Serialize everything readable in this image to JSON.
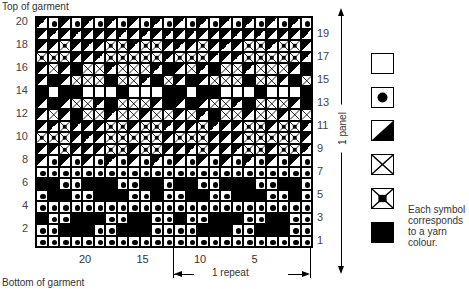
{
  "labels": {
    "top": "Top of garment",
    "bottom": "Bottom of garment",
    "panel": "1 panel",
    "repeat": "1 repeat",
    "note": "Each symbol corresponds to a yarn colour."
  },
  "left_row_numbers": [
    "20",
    "18",
    "16",
    "14",
    "12",
    "10",
    "8",
    "6",
    "4",
    "2"
  ],
  "right_row_numbers": [
    "19",
    "17",
    "15",
    "13",
    "11",
    "9",
    "7",
    "5",
    "3",
    "1"
  ],
  "column_numbers": [
    "20",
    "15",
    "10",
    "5"
  ],
  "legend": [
    {
      "symbol": "white-square",
      "code": "W"
    },
    {
      "symbol": "dot",
      "code": "D"
    },
    {
      "symbol": "diagonal-half",
      "code": "G"
    },
    {
      "symbol": "cross",
      "code": "X"
    },
    {
      "symbol": "framed-cross",
      "code": "F"
    },
    {
      "symbol": "black-square",
      "code": "B"
    }
  ],
  "chart_data": {
    "type": "table",
    "columns": 24,
    "rows": 20,
    "repeat_width": 12,
    "codes": {
      "W": "white",
      "D": "dot",
      "G": "diagonal",
      "X": "cross",
      "F": "framed cross",
      "B": "black"
    },
    "grid_top_to_bottom": [
      "GDGDGDGDGDGDGDGDGDGDGDGD",
      "GGGGGGGGGGGGGGGGGGGGGGGG",
      "GGFGGGFFGFFGGGFGGGFFGFFG",
      "FFFGGGFFFFFGFFFGGGFFFFFG",
      "GXGBXXGXXXGBGXGBXXGXXXGB",
      "GBGXXXBXXGBXGBGXXXBXXGBX",
      "BWBBWWWBWWWBBWBBWWWBWWWB",
      "GBGXXGBXXXGBGBGXXGBXXXGB",
      "GXGBXXGXXGXXGXGBXXGXXGXX",
      "GGFGGGFFGFFGGGFGGGFFGFFG",
      "FFFGGGFFFFFGFFFGGGFFFFFG",
      "GGFGGGFFGFFGGGFGGGFFGFFG",
      "GDGDGDGDGDGDGDGDGDGDGDGD",
      "DDDDDDDDDDDDDDDDDDDDDDDD",
      "BBDDBBBDDBBDBBDDBBBDDBBD",
      "DBBDDBBBDDBDDBBDDBBBDDBD",
      "DDDDDDDDDDDDDDDDDDDDDDDD",
      "BDDBBBDDBBDDBDDBBBDDBBDD",
      "DDBBBDDBBBDDDDBBBDDBBBDD",
      "DDDDDDDDDDDDDDDDDDDDDDDD"
    ]
  }
}
